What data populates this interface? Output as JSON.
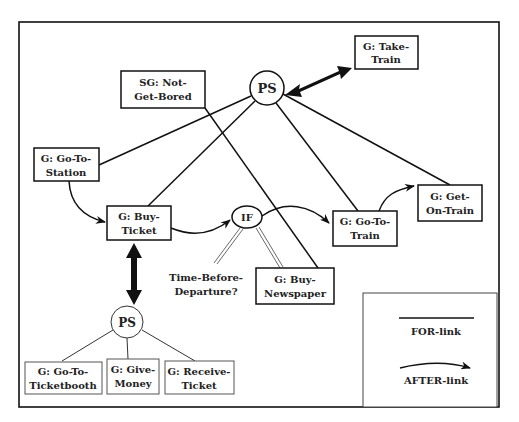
{
  "diagram": {
    "nodes": {
      "ps_top": {
        "label": "PS"
      },
      "take_train": {
        "line1": "G: Take-",
        "line2": "Train"
      },
      "not_get_bored": {
        "line1": "SG: Not-",
        "line2": "Get-Bored"
      },
      "go_to_station": {
        "line1": "G: Go-To-",
        "line2": "Station"
      },
      "buy_ticket": {
        "line1": "G: Buy-",
        "line2": "Ticket"
      },
      "if_node": {
        "label": "IF"
      },
      "go_to_train": {
        "line1": "G: Go-To-",
        "line2": "Train"
      },
      "get_on_train": {
        "line1": "G: Get-",
        "line2": "On-Train"
      },
      "buy_newspaper": {
        "line1": "G: Buy-",
        "line2": "Newspaper"
      },
      "condition": {
        "line1": "Time-Before-",
        "line2": "Departure?"
      },
      "ps_bottom": {
        "label": "PS"
      },
      "go_to_ticketbooth": {
        "line1": "G: Go-To-",
        "line2": "Ticketbooth"
      },
      "give_money": {
        "line1": "G: Give-",
        "line2": "Money"
      },
      "receive_ticket": {
        "line1": "G: Receive-",
        "line2": "Ticket"
      }
    },
    "legend": {
      "for_link": "FOR-link",
      "after_link": "AFTER-link"
    }
  }
}
